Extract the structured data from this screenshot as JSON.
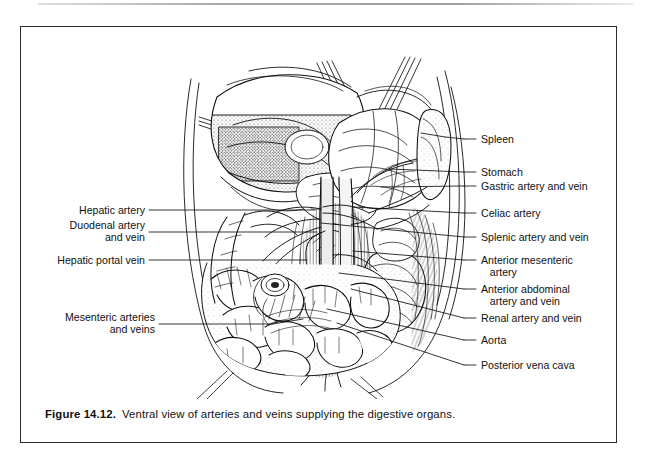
{
  "figure": {
    "caption_label": "Figure 14.12.",
    "caption_text": "Ventral view of arteries and veins supplying the digestive organs.",
    "frame_color": "#2b2b2b",
    "ink_color": "#111111",
    "background_color": "#ffffff"
  },
  "illustration": {
    "name": "ventral-dissection-abdominal-vasculature",
    "description": "Ventral dissection view of the abdominal cavity showing liver, stomach, spleen, pancreas, kidney, coiled small intestine and the aorta and posterior vena cava with their branches, held open by retractor pins."
  },
  "labels_right": [
    {
      "text": "Spleen",
      "y": 112,
      "lines": 1
    },
    {
      "text": "Stomach",
      "y": 145,
      "lines": 1
    },
    {
      "text": "Gastric artery and vein",
      "y": 159,
      "lines": 1
    },
    {
      "text": "Celiac artery",
      "y": 186,
      "lines": 1
    },
    {
      "text": "Splenic artery and vein",
      "y": 210,
      "lines": 1
    },
    {
      "text": "Anterior mesenteric\n   artery",
      "y": 233,
      "lines": 2
    },
    {
      "text": "Anterior abdominal\n   artery and vein",
      "y": 262,
      "lines": 2
    },
    {
      "text": "Renal artery and vein",
      "y": 291,
      "lines": 1
    },
    {
      "text": "Aorta",
      "y": 313,
      "lines": 1
    },
    {
      "text": "Posterior vena cava",
      "y": 338,
      "lines": 1
    }
  ],
  "labels_left": [
    {
      "text": "Hepatic artery",
      "y": 183,
      "lines": 1
    },
    {
      "text": "Duodenal artery\nand vein",
      "y": 205,
      "lines": 2
    },
    {
      "text": "Hepatic portal vein",
      "y": 233,
      "lines": 1
    },
    {
      "text": "Mesenteric arteries\nand veins",
      "y": 297,
      "lines": 2
    }
  ]
}
